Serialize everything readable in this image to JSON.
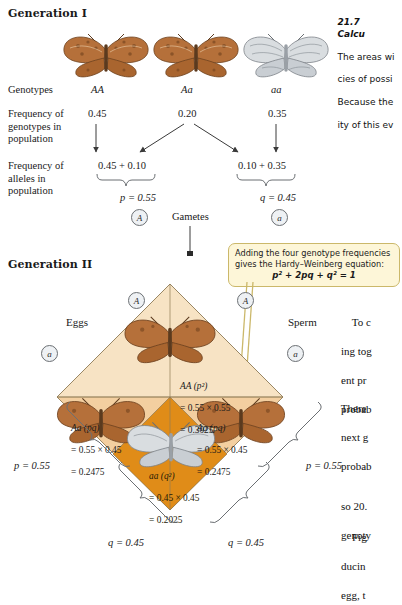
{
  "figure": {
    "caption_number": "21.7",
    "caption_title": "Calcu",
    "caption_lines": [
      "The areas wi",
      "cies of possi",
      "Because the",
      "ity of this ev"
    ]
  },
  "generation_one": {
    "heading": "Generation I",
    "row_labels": {
      "genotypes": "Genotypes",
      "freq_genotypes": "Frequency of\ngenotypes in\npopulation",
      "freq_alleles": "Frequency of\nalleles in\npopulation"
    },
    "genotypes": [
      "AA",
      "Aa",
      "aa"
    ],
    "genotype_frequencies": [
      "0.45",
      "0.20",
      "0.35"
    ],
    "allele_sums": [
      "0.45 + 0.10",
      "0.10 + 0.35"
    ],
    "allele_freq_labels": [
      "p = 0.55",
      "q = 0.45"
    ],
    "allele_symbols": [
      "A",
      "a"
    ],
    "gametes_label": "Gametes"
  },
  "callout": {
    "line1": "Adding the four genotype frequencies",
    "line2": "gives the Hardy–Weinberg equation:",
    "equation": "p² + 2pq + q² = 1"
  },
  "generation_two": {
    "heading": "Generation II",
    "eggs_label": "Eggs",
    "sperm_label": "Sperm",
    "egg_alleles": [
      "A",
      "a"
    ],
    "sperm_alleles": [
      "A",
      "a"
    ],
    "edge_labels": {
      "egg_p": "p = 0.55",
      "egg_q": "q = 0.45",
      "sperm_p": "p = 0.55",
      "sperm_q": "q = 0.45"
    },
    "cells": [
      {
        "genotype": "AA (p²)",
        "product": "= 0.55 × 0.55",
        "result": "= 0.3025",
        "fill": "#f7e3c4"
      },
      {
        "genotype": "Aa (pq)",
        "product": "= 0.55 × 0.45",
        "result": "= 0.2475",
        "fill": "#f3cfa0"
      },
      {
        "genotype": "Aa (pq)",
        "product": "= 0.55 × 0.45",
        "result": "= 0.2475",
        "fill": "#f3cfa0"
      },
      {
        "genotype": "aa (q²)",
        "product": "= 0.45 × 0.45",
        "result": "= 0.2025",
        "fill": "#e08c18"
      }
    ]
  },
  "body_text": {
    "para1": [
      "    To c",
      "ing tog",
      "ent pr",
      "probab"
    ],
    "para2": [
      "There",
      "next g",
      "probab"
    ],
    "para3": [
      "so 20.",
      "genoty"
    ],
    "para4": [
      "    Fig",
      "ducin",
      "egg, t"
    ]
  },
  "colors": {
    "cell_light": "#f7e3c4",
    "cell_mid": "#f3cfa0",
    "cell_dark": "#e08c18",
    "callout_bg": "#fdf6d8",
    "callout_border": "#cbb86a",
    "rule": "#6b6f73"
  }
}
